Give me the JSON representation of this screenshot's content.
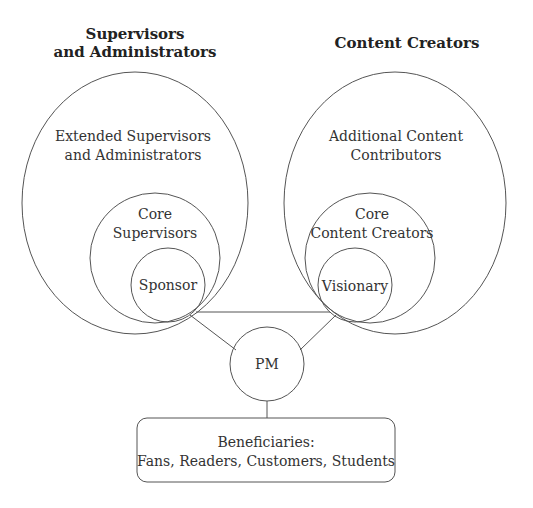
{
  "diagram": {
    "type": "stakeholder-map",
    "groups": {
      "left": {
        "title": [
          "Supervisors",
          "and Administrators"
        ],
        "outer": [
          "Extended Supervisors",
          "and Administrators"
        ],
        "middle": [
          "Core",
          "Supervisors"
        ],
        "inner": "Sponsor"
      },
      "right": {
        "title": [
          "Content Creators"
        ],
        "outer": [
          "Additional Content",
          "Contributors"
        ],
        "middle": [
          "Core",
          "Content Creators"
        ],
        "inner": "Visionary"
      }
    },
    "center": {
      "label": "PM"
    },
    "beneficiaries": {
      "lines": [
        "Beneficiaries:",
        "Fans, Readers, Customers, Students"
      ]
    },
    "connections": [
      [
        "Sponsor",
        "Visionary"
      ],
      [
        "Sponsor",
        "PM"
      ],
      [
        "Visionary",
        "PM"
      ],
      [
        "PM",
        "Beneficiaries"
      ]
    ],
    "colors": {
      "stroke": "#555555",
      "text": "#333333",
      "background": "#ffffff"
    }
  }
}
